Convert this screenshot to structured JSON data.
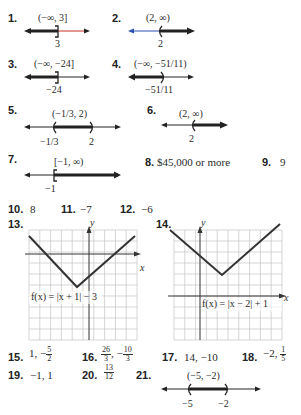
{
  "answers": [
    {
      "n": "1.",
      "interval": "(−∞, 3]",
      "label": "3"
    },
    {
      "n": "2.",
      "interval": "(2, ∞)",
      "label": "2"
    },
    {
      "n": "3.",
      "interval": "(−∞, −24]",
      "label": "−24"
    },
    {
      "n": "4.",
      "interval": "(−∞, −51/11)",
      "label": "−51/11"
    },
    {
      "n": "5.",
      "interval": "(−1/3, 2)",
      "labels": [
        "−1/3",
        "2"
      ]
    },
    {
      "n": "6.",
      "interval": "(2, ∞)",
      "label": "2"
    },
    {
      "n": "7.",
      "interval": "[−1, ∞)",
      "label": "−1"
    },
    {
      "n": "8.",
      "value": "$45,000 or more"
    },
    {
      "n": "9.",
      "value": "9"
    },
    {
      "n": "10.",
      "value": "8"
    },
    {
      "n": "11.",
      "value": "−7"
    },
    {
      "n": "12.",
      "value": "−6"
    },
    {
      "n": "13.",
      "function": "f(x) = |x + 1| − 3",
      "axis_x": "x",
      "axis_y": "y"
    },
    {
      "n": "14.",
      "function": "f(x) = |x − 2| + 1",
      "axis_x": "x",
      "axis_y": "y"
    },
    {
      "n": "15.",
      "value_a": "1, −",
      "frac_n": "5",
      "frac_d": "2"
    },
    {
      "n": "16.",
      "frac1_n": "26",
      "frac1_d": "3",
      "sep": ", −",
      "frac2_n": "10",
      "frac2_d": "3"
    },
    {
      "n": "17.",
      "value": "14, −10"
    },
    {
      "n": "18.",
      "value_a": "−2, ",
      "frac_n": "1",
      "frac_d": "5"
    },
    {
      "n": "19.",
      "value": "−1, 1"
    },
    {
      "n": "20.",
      "frac_n": "13",
      "frac_d": "12"
    },
    {
      "n": "21.",
      "interval": "(−5, −2)",
      "labels": [
        "−5",
        "−2"
      ]
    }
  ],
  "colors": {
    "line": "#222222",
    "red": "#c8302c",
    "blue": "#2a4fb0",
    "grid": "#bdbdbd"
  }
}
